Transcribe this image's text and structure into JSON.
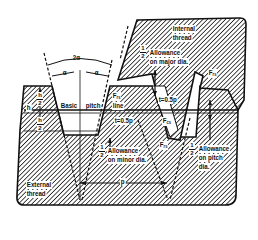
{
  "diagram": {
    "labels": {
      "angle_total": "2α",
      "angle_left": "α",
      "angle_right": "α",
      "internal_thread_1": "Internal",
      "internal_thread_2": "thread",
      "external_thread_1": "External",
      "external_thread_2": "thread",
      "allowance_major_frac": "½",
      "allowance_major_1": "Allowance",
      "allowance_major_2": "on major dia.",
      "allowance_minor_1": "Allowance",
      "allowance_minor_2": "on minor dia.",
      "allowance_pitch_1": "Allowance",
      "allowance_pitch_2": "on pitch",
      "allowance_pitch_3": "dia.",
      "basic_pitch_line_1": "Basic",
      "basic_pitch_line_2": "pitch",
      "basic_pitch_line_3": "line",
      "height": "h",
      "half_height_num": "h",
      "half_height_den": "2",
      "half_num": "1",
      "half_den": "2",
      "t_upper": "t=0.5p",
      "t_lower": "t=0.5p",
      "f_rs_top_right": "F",
      "f_rs_top_right_sub": "rs",
      "f_rs_line": "F",
      "f_rs_line_sub": "rs",
      "f_cs": "F",
      "f_cs_sub": "cs",
      "f_rs_lower": "F",
      "f_rs_lower_sub": "rs",
      "pitch": "p"
    },
    "colors": {
      "ink": "#111111",
      "paper": "#ffffff"
    }
  }
}
